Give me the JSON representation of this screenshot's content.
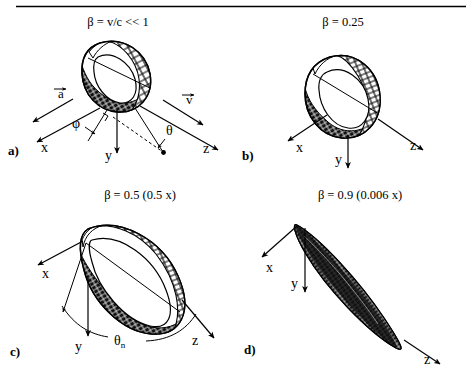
{
  "figure": {
    "type": "scientific-diagram",
    "top_rule": true,
    "panels": [
      {
        "id": "a",
        "panel_label": "a)",
        "title": "β = v/c << 1",
        "beta": "v/c << 1",
        "scale_note": "",
        "shape": "toroidal-donut-lobe",
        "axes": [
          {
            "name": "x",
            "label": "x"
          },
          {
            "name": "y",
            "label": "y"
          },
          {
            "name": "z",
            "label": "z"
          }
        ],
        "vectors": [
          {
            "name": "acceleration-vector",
            "label": "a",
            "overbar": true
          },
          {
            "name": "velocity-vector",
            "label": "v",
            "overbar": true
          }
        ],
        "angles": [
          {
            "name": "phi-angle",
            "label": "φ"
          },
          {
            "name": "theta-angle",
            "label": "θ"
          }
        ],
        "has_dashed_ray": true,
        "has_right_angle_mark": true
      },
      {
        "id": "b",
        "panel_label": "b)",
        "title": "β = 0.25",
        "beta": "0.25",
        "scale_note": "",
        "shape": "tilted-torus-lobe",
        "axes": [
          {
            "name": "x",
            "label": "x"
          },
          {
            "name": "y",
            "label": "y"
          },
          {
            "name": "z",
            "label": "z"
          }
        ],
        "vectors": [],
        "angles": [],
        "has_dashed_ray": false,
        "has_right_angle_mark": false
      },
      {
        "id": "c",
        "panel_label": "c)",
        "title": "β = 0.5  (0.5 x)",
        "beta": "0.5",
        "scale_note": "0.5 x",
        "shape": "forward-tilted-lobe",
        "axes": [
          {
            "name": "x",
            "label": "x"
          },
          {
            "name": "y",
            "label": "y"
          },
          {
            "name": "z",
            "label": "z"
          }
        ],
        "vectors": [],
        "angles": [
          {
            "name": "theta-n-angle",
            "label": "θ",
            "subscript": "n"
          }
        ],
        "has_dashed_ray": false,
        "has_right_angle_mark": false
      },
      {
        "id": "d",
        "panel_label": "d)",
        "title": "β = 0.9  (0.006 x)",
        "beta": "0.9",
        "scale_note": "0.006 x",
        "shape": "narrow-beamed-lobe",
        "axes": [
          {
            "name": "x",
            "label": "x"
          },
          {
            "name": "y",
            "label": "y"
          },
          {
            "name": "z",
            "label": "z"
          }
        ],
        "vectors": [],
        "angles": [],
        "has_dashed_ray": false,
        "has_right_angle_mark": false
      }
    ],
    "colors": {
      "ink": "#000000",
      "background": "#ffffff"
    }
  }
}
